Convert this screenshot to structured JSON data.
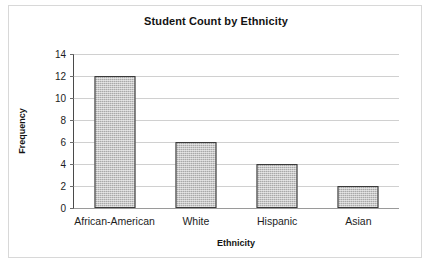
{
  "chart_data": {
    "type": "bar",
    "title": "Student Count by Ethnicity",
    "xlabel": "Ethnicity",
    "ylabel": "Frequency",
    "categories": [
      "African-American",
      "White",
      "Hispanic",
      "Asian"
    ],
    "values": [
      12,
      6,
      4,
      2
    ],
    "ylim": [
      0,
      14
    ],
    "yticks": [
      0,
      2,
      4,
      6,
      8,
      10,
      12,
      14
    ],
    "ytick_labels": [
      "0",
      "2",
      "4",
      "6",
      "8",
      "10",
      "12",
      "14"
    ],
    "grid": "horizontal",
    "legend": "none",
    "series": [
      {
        "name": "Frequency",
        "values": [
          12,
          6,
          4,
          2
        ],
        "fill": "#a9a9a9",
        "pattern": "dotted-gray",
        "border": "#3a3a3a"
      }
    ],
    "colors": {
      "bar_fill": "#a9a9a9",
      "bar_border": "#3a3a3a",
      "gridline": "#d0d0d0",
      "axis": "#4a4a4a",
      "text": "#131313",
      "frame": "#d8d8d8",
      "background": "#ffffff"
    }
  }
}
